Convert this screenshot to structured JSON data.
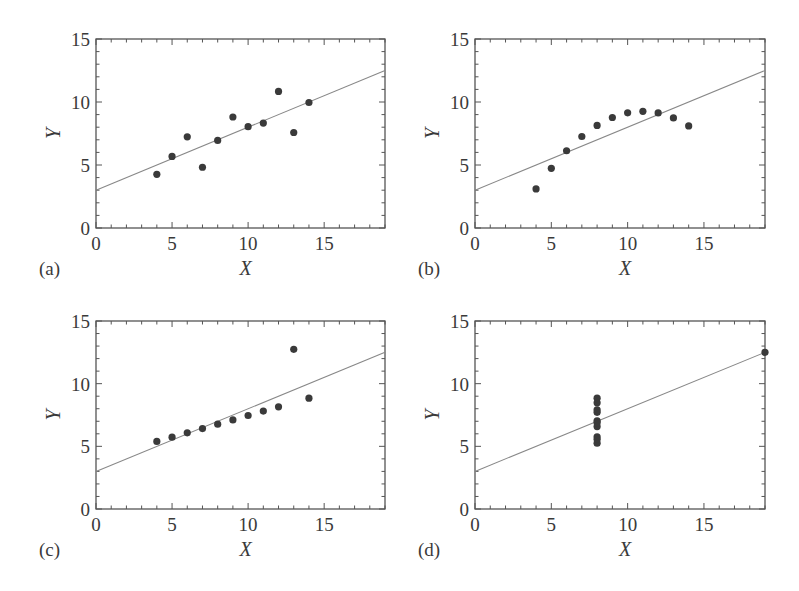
{
  "figure": {
    "title": "",
    "colors": {
      "frame": "#555555",
      "points": "#3a3a3a",
      "fit_line": "#888888",
      "text": "#3a3a3a"
    }
  },
  "chart_data": [
    {
      "type": "scatter",
      "panel_label": "(a)",
      "xlabel": "X",
      "ylabel": "Y",
      "xlim": [
        0,
        19
      ],
      "ylim": [
        0,
        15
      ],
      "xticks": [
        0,
        5,
        10,
        15
      ],
      "yticks": [
        0,
        5,
        10,
        15
      ],
      "grid": false,
      "x": [
        10,
        8,
        13,
        9,
        11,
        14,
        6,
        4,
        12,
        7,
        5
      ],
      "y": [
        8.04,
        6.95,
        7.58,
        8.81,
        8.33,
        9.96,
        7.24,
        4.26,
        10.84,
        4.82,
        5.68
      ],
      "fit_line": {
        "intercept": 3.0,
        "slope": 0.5
      }
    },
    {
      "type": "scatter",
      "panel_label": "(b)",
      "xlabel": "X",
      "ylabel": "Y",
      "xlim": [
        0,
        19
      ],
      "ylim": [
        0,
        15
      ],
      "xticks": [
        0,
        5,
        10,
        15
      ],
      "yticks": [
        0,
        5,
        10,
        15
      ],
      "grid": false,
      "x": [
        10,
        8,
        13,
        9,
        11,
        14,
        6,
        4,
        12,
        7,
        5
      ],
      "y": [
        9.14,
        8.14,
        8.74,
        8.77,
        9.26,
        8.1,
        6.13,
        3.1,
        9.13,
        7.26,
        4.74
      ],
      "fit_line": {
        "intercept": 3.0,
        "slope": 0.5
      }
    },
    {
      "type": "scatter",
      "panel_label": "(c)",
      "xlabel": "X",
      "ylabel": "Y",
      "xlim": [
        0,
        19
      ],
      "ylim": [
        0,
        15
      ],
      "xticks": [
        0,
        5,
        10,
        15
      ],
      "yticks": [
        0,
        5,
        10,
        15
      ],
      "grid": false,
      "x": [
        10,
        8,
        13,
        9,
        11,
        14,
        6,
        4,
        12,
        7,
        5
      ],
      "y": [
        7.46,
        6.77,
        12.74,
        7.11,
        7.81,
        8.84,
        6.08,
        5.39,
        8.15,
        6.42,
        5.73
      ],
      "fit_line": {
        "intercept": 3.0,
        "slope": 0.5
      }
    },
    {
      "type": "scatter",
      "panel_label": "(d)",
      "xlabel": "X",
      "ylabel": "Y",
      "xlim": [
        0,
        19
      ],
      "ylim": [
        0,
        15
      ],
      "xticks": [
        0,
        5,
        10,
        15
      ],
      "yticks": [
        0,
        5,
        10,
        15
      ],
      "grid": false,
      "x": [
        8,
        8,
        8,
        8,
        8,
        8,
        8,
        19,
        8,
        8,
        8
      ],
      "y": [
        6.58,
        5.76,
        7.71,
        8.84,
        8.47,
        7.04,
        5.25,
        12.5,
        5.56,
        7.91,
        6.89
      ],
      "fit_line": {
        "intercept": 3.0,
        "slope": 0.5
      }
    }
  ]
}
